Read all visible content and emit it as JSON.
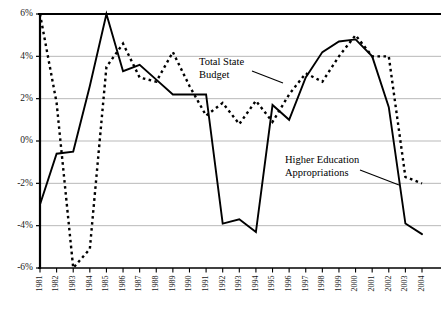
{
  "chart_data": {
    "type": "line",
    "title": "",
    "xlabel": "",
    "ylabel": "",
    "grid": true,
    "legend_position": "inline-annotations",
    "ylim": [
      -6,
      6
    ],
    "yticks": [
      6,
      4,
      2,
      0,
      -2,
      -4,
      -6
    ],
    "ytick_labels": [
      "6%",
      "4%",
      "2%",
      "0%",
      "-2%",
      "-4%",
      "-6%"
    ],
    "categories": [
      "1981",
      "1982",
      "1983",
      "1984",
      "1985",
      "1986",
      "1987",
      "1988",
      "1989",
      "1990",
      "1991",
      "1992",
      "1993",
      "1994",
      "1995",
      "1996",
      "1997",
      "1998",
      "1999",
      "2000",
      "2001",
      "2002",
      "2003",
      "2004"
    ],
    "series": [
      {
        "name": "Higher Education Appropriations",
        "style": "solid",
        "color": "#000000",
        "values": [
          -3.0,
          -0.6,
          -0.5,
          2.6,
          6.0,
          3.3,
          3.6,
          2.9,
          2.2,
          2.2,
          2.2,
          -3.9,
          -3.7,
          -4.3,
          1.7,
          1.0,
          3.0,
          4.2,
          4.7,
          4.8,
          4.0,
          1.6,
          -3.9,
          -4.4
        ]
      },
      {
        "name": "Total State Budget",
        "style": "dashed",
        "color": "#000000",
        "values": [
          6.0,
          1.8,
          -6.0,
          -5.1,
          3.5,
          4.6,
          3.0,
          2.8,
          4.2,
          2.6,
          1.2,
          1.8,
          0.8,
          1.9,
          0.9,
          2.2,
          3.2,
          2.8,
          4.0,
          5.0,
          4.0,
          4.0,
          -1.7,
          -2.0
        ]
      }
    ],
    "annotations": [
      {
        "id": "total-state-budget",
        "line1": "Total State",
        "line2": "Budget",
        "target_year": "1993"
      },
      {
        "id": "higher-education-appropriations",
        "line1": "Higher Education",
        "line2": "Appropriations",
        "target_year": "2003"
      }
    ],
    "axis_color": "#000000",
    "grid_color": "#b9b9b9"
  }
}
